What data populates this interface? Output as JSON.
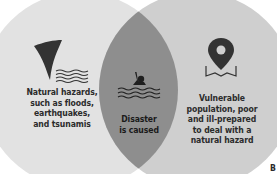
{
  "diagram": {
    "type": "venn",
    "left": {
      "icon": "tornado-waves-icon",
      "text": "Natural hazards, such as floods, earthquakes, and tsunamis",
      "lines": [
        "Natural hazards,",
        "such as floods,",
        "earthquakes,",
        "and tsunamis"
      ]
    },
    "right": {
      "icon": "map-pin-icon",
      "text": "Vulnerable population, poor and ill-prepared to deal with a natural hazard",
      "lines": [
        "Vulnerable",
        "population, poor",
        "and ill-prepared",
        "to deal with a",
        "natural hazard"
      ]
    },
    "intersection": {
      "icon": "drowning-person-icon",
      "lines": [
        "Disaster",
        "is caused"
      ]
    },
    "corner_fragment": "B"
  },
  "colors": {
    "left_circle": "#e2e2e2",
    "right_circle": "#cfcfcf",
    "intersection": "#8e8e8e",
    "text": "#2b2b2b",
    "icon": "#333333"
  }
}
